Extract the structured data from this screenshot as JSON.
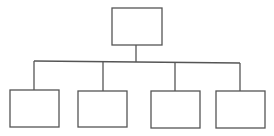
{
  "diagram": {
    "type": "org-chart",
    "line_color": "#555555",
    "background": "#ffffff",
    "root": {
      "id": "root",
      "label": "",
      "x": 112,
      "y": 8,
      "w": 50,
      "h": 37
    },
    "connector_bar": {
      "x1": 34,
      "y1": 61,
      "x2": 240,
      "y2": 63
    },
    "root_stem": {
      "x": 136,
      "y1": 45,
      "y2": 62
    },
    "children": [
      {
        "id": "child-1",
        "label": "",
        "x": 10,
        "y": 90,
        "w": 49,
        "h": 37,
        "stem_x": 34
      },
      {
        "id": "child-2",
        "label": "",
        "x": 78,
        "y": 91,
        "w": 49,
        "h": 36,
        "stem_x": 103
      },
      {
        "id": "child-3",
        "label": "",
        "x": 151,
        "y": 91,
        "w": 49,
        "h": 37,
        "stem_x": 175
      },
      {
        "id": "child-4",
        "label": "",
        "x": 216,
        "y": 91,
        "w": 49,
        "h": 37,
        "stem_x": 240
      }
    ]
  }
}
